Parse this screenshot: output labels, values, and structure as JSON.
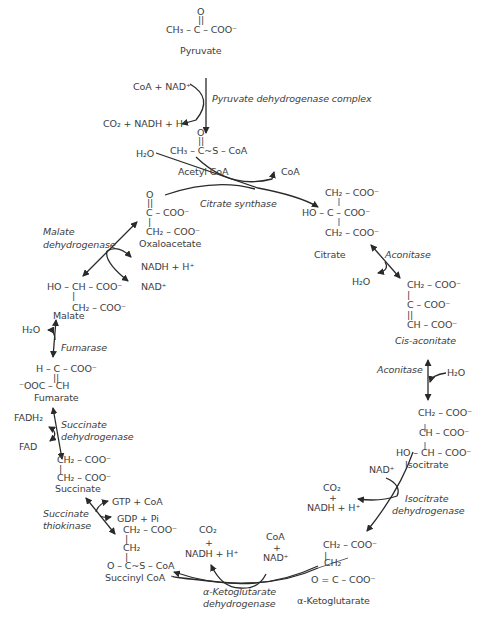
{
  "diagram": {
    "type": "metabolic-pathway",
    "colors": {
      "text": "#3d3d3d",
      "arrows": "#2a2a2a",
      "background": "#ffffff"
    }
  },
  "molecules": {
    "pyruvate": {
      "lines": [
        "O",
        "||",
        "CH₃ – C – COO⁻"
      ],
      "name": "Pyruvate"
    },
    "acetyl_coa": {
      "lines": [
        "O",
        "||",
        "CH₃ – C~S – CoA"
      ],
      "name": "Acetyl CoA"
    },
    "oxaloacetate": {
      "lines": [
        "O",
        "||",
        "C – COO⁻",
        "|",
        "CH₂ – COO⁻"
      ],
      "name": "Oxaloacetate"
    },
    "citrate": {
      "lines": [
        "CH₂ – COO⁻",
        "|",
        "HO – C – COO⁻",
        "|",
        "CH₂ – COO⁻"
      ],
      "name": "Citrate"
    },
    "cis_aconitate": {
      "lines": [
        "CH₂ – COO⁻",
        "|",
        "C – COO⁻",
        "||",
        "CH – COO⁻"
      ],
      "name": "Cis-aconitate"
    },
    "isocitrate": {
      "lines": [
        "CH₂ – COO⁻",
        "|",
        "CH – COO⁻",
        "|",
        "HO – CH – COO⁻"
      ],
      "name": "Isocitrate"
    },
    "alpha_ketoglutarate": {
      "lines": [
        "CH₂ – COO⁻",
        "|",
        "CH₂",
        "O = C – COO⁻"
      ],
      "name": "α-Ketoglutarate"
    },
    "succinyl_coa": {
      "lines": [
        "CH₂ – COO⁻",
        "|",
        "CH₂",
        "|",
        "O – C~S – CoA"
      ],
      "name": "Succinyl CoA"
    },
    "succinate": {
      "lines": [
        "CH₂ – COO⁻",
        "|",
        "CH₂ – COO⁻"
      ],
      "name": "Succinate"
    },
    "fumarate": {
      "lines": [
        "H – C – COO⁻",
        "||",
        "⁻OOC – CH"
      ],
      "name": "Fumarate"
    },
    "malate": {
      "lines": [
        "HO – CH – COO⁻",
        "|",
        "CH₂ – COO⁻"
      ],
      "name": "Malate"
    }
  },
  "enzymes": {
    "pyruvate_dh": "Pyruvate dehydrogenase complex",
    "citrate_synthase": "Citrate synthase",
    "aconitase_1": "Aconitase",
    "aconitase_2": "Aconitase",
    "isocitrate_dh_1": "Isocitrate",
    "isocitrate_dh_2": "dehydrogenase",
    "akg_dh_1": "α-Ketoglutarate",
    "akg_dh_2": "dehydrogenase",
    "succinate_thiokinase_1": "Succinate",
    "succinate_thiokinase_2": "thiokinase",
    "succinate_dh_1": "Succinate",
    "succinate_dh_2": "dehydrogenase",
    "fumarase": "Fumarase",
    "malate_dh_1": "Malate",
    "malate_dh_2": "dehydrogenase"
  },
  "cofactors": {
    "pdh_in": "CoA + NAD⁺",
    "pdh_out": "CO₂ + NADH + H⁺",
    "cs_in": "H₂O",
    "cs_out": "CoA",
    "acon1_out": "H₂O",
    "acon2_in": "H₂O",
    "idh_in": "NAD⁺",
    "idh_out_1": "CO₂",
    "idh_out_2": "+",
    "idh_out_3": "NADH + H⁺",
    "akg_in_1": "CoA",
    "akg_in_2": "+",
    "akg_in_3": "NAD⁺",
    "akg_out_1": "CO₂",
    "akg_out_2": "+",
    "akg_out_3": "NADH + H⁺",
    "stk_1": "GTP + CoA",
    "stk_2": "GDP + Pi",
    "sdh_1": "FADH₂",
    "sdh_2": "FAD",
    "fum_in": "H₂O",
    "mdh_1": "NADH + H⁺",
    "mdh_2": "NAD⁺"
  }
}
